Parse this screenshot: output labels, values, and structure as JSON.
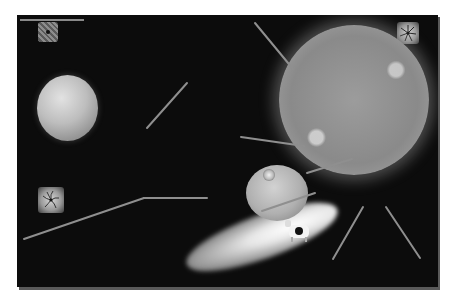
{
  "scene": {
    "background_color": "#0c0c0c",
    "accent_color": "#9a9a9a",
    "objects": [
      {
        "name": "level-progress-bar",
        "type": "bar"
      },
      {
        "name": "checkered-tile",
        "icon": "checkered-square-icon"
      },
      {
        "name": "vortex-tile-top-right",
        "icon": "vortex-fan-icon"
      },
      {
        "name": "vortex-tile-left",
        "icon": "vortex-fan-icon"
      },
      {
        "name": "planet",
        "icon": "planet-icon"
      },
      {
        "name": "sun",
        "icon": "sun-icon"
      },
      {
        "name": "space-station",
        "icon": "space-station-icon"
      },
      {
        "name": "comet",
        "icon": "comet-icon"
      },
      {
        "name": "cow",
        "icon": "cow-icon"
      }
    ],
    "beams": [
      {
        "x1": 238,
        "y1": 8,
        "x2": 276,
        "y2": 54
      },
      {
        "x1": 130,
        "y1": 113,
        "x2": 170,
        "y2": 68
      },
      {
        "x1": 224,
        "y1": 122,
        "x2": 287,
        "y2": 131
      },
      {
        "x1": 290,
        "y1": 158,
        "x2": 335,
        "y2": 144
      },
      {
        "x1": 245,
        "y1": 196,
        "x2": 298,
        "y2": 178
      },
      {
        "x1": 7,
        "y1": 224,
        "x2": 127,
        "y2": 183
      },
      {
        "x1": 127,
        "y1": 183,
        "x2": 190,
        "y2": 183
      },
      {
        "x1": 316,
        "y1": 244,
        "x2": 346,
        "y2": 192
      },
      {
        "x1": 369,
        "y1": 192,
        "x2": 403,
        "y2": 243
      }
    ]
  }
}
